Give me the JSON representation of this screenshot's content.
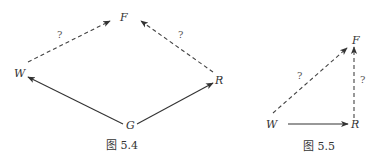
{
  "figure_5_4": {
    "caption": "图 5.4",
    "nodes": {
      "F": "F",
      "W": "W",
      "R": "R",
      "G": "G"
    },
    "edges": [
      {
        "from": "G",
        "to": "W",
        "style": "solid",
        "label": ""
      },
      {
        "from": "G",
        "to": "R",
        "style": "solid",
        "label": ""
      },
      {
        "from": "W",
        "to": "F",
        "style": "dashed",
        "label": "?"
      },
      {
        "from": "R",
        "to": "F",
        "style": "dashed",
        "label": "?"
      }
    ],
    "labels": {
      "wf": "?",
      "rf": "?"
    }
  },
  "figure_5_5": {
    "caption": "图 5.5",
    "nodes": {
      "F": "F",
      "W": "W",
      "R": "R"
    },
    "edges": [
      {
        "from": "W",
        "to": "R",
        "style": "solid",
        "label": ""
      },
      {
        "from": "W",
        "to": "F",
        "style": "dashed",
        "label": "?"
      },
      {
        "from": "R",
        "to": "F",
        "style": "dashed",
        "label": "?"
      }
    ],
    "labels": {
      "wf": "?",
      "rf": "?"
    }
  },
  "colors": {
    "ink": "#333333",
    "background": "#ffffff"
  }
}
